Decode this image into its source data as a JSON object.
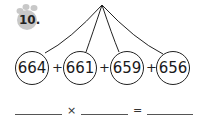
{
  "problem": {
    "number": "10.",
    "badge_color": "#c8c8c8",
    "addends": [
      "664",
      "661",
      "659",
      "656"
    ],
    "operator_plus": "+",
    "answer_row": {
      "times_symbol": "×",
      "equals_symbol": "=",
      "blanks": [
        "",
        "",
        ""
      ]
    }
  }
}
